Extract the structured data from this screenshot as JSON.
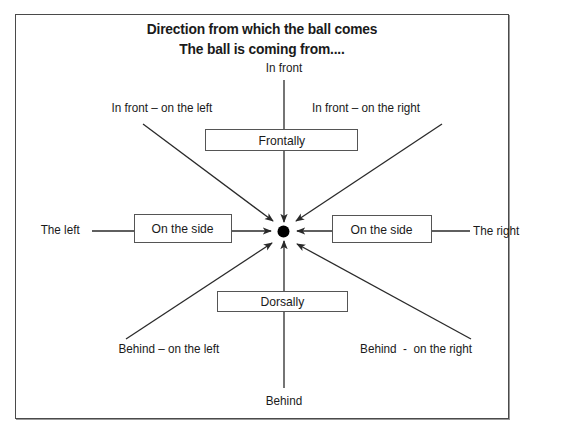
{
  "title": {
    "line1": "Direction from which the ball comes",
    "line2": "The ball is coming from...."
  },
  "directions": {
    "front": "In front",
    "front_left": "In front – on the left",
    "front_right": "In front – on the right",
    "left": "The left",
    "right": "The right",
    "behind_left": "Behind – on the left",
    "behind_right": "Behind  -  on the right",
    "behind": "Behind"
  },
  "categories": {
    "frontally": "Frontally",
    "side_left": "On the side",
    "side_right": "On the side",
    "dorsally": "Dorsally"
  },
  "center": {
    "icon": "ball-icon",
    "color": "#000000"
  },
  "colors": {
    "line": "#2a2a2a",
    "frame": "#4a4a4a",
    "text": "#1a1a1a"
  }
}
